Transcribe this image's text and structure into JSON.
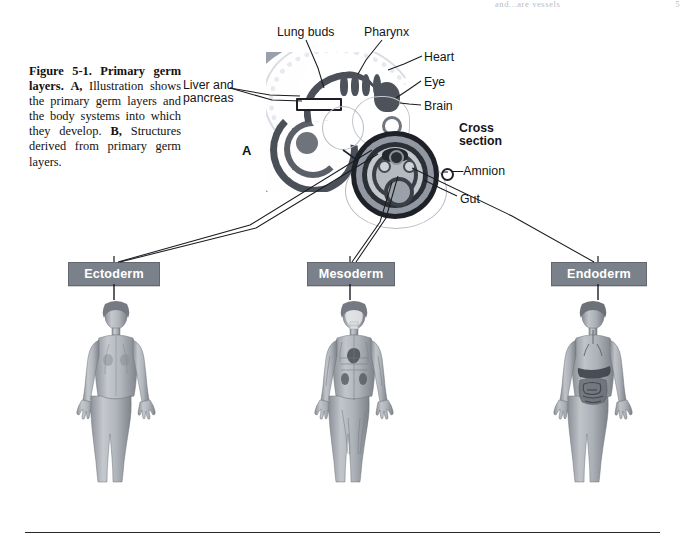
{
  "page": {
    "running_head_left": "and...are vessels",
    "running_head_right": "5"
  },
  "caption": {
    "figure_number": "Figure 5-1.",
    "figure_title": "Primary germ layers.",
    "part_a_letter": "A,",
    "part_a_text": "Illustration shows the primary germ layers and the body systems into which they develop.",
    "part_b_letter": "B,",
    "part_b_text": "Structures derived from primary germ layers.",
    "full_text": "Figure 5-1. Primary germ layers. A, Illustration shows the primary germ layers and the body systems into which they develop. B, Structures derived from primary germ layers."
  },
  "panel_a": {
    "letter": "A",
    "labels": {
      "lung_buds": "Lung buds",
      "pharynx": "Pharynx",
      "heart": "Heart",
      "eye": "Eye",
      "brain": "Brain",
      "liver_and_pancreas_line1": "Liver and",
      "liver_and_pancreas_line2": "pancreas"
    }
  },
  "cross_section": {
    "title_line1": "Cross",
    "title_line2": "section",
    "amnion_label": "—Amnion",
    "gut_label": "Gut"
  },
  "germ_layers": [
    {
      "id": "ectoderm",
      "label": "Ectoderm",
      "figure_alt": "Female body figure showing skin and nervous system derivatives"
    },
    {
      "id": "mesoderm",
      "label": "Mesoderm",
      "figure_alt": "Female body figure showing muscles, skeleton, heart and kidneys"
    },
    {
      "id": "endoderm",
      "label": "Endoderm",
      "figure_alt": "Female body figure showing digestive and respiratory linings"
    }
  ],
  "colors": {
    "box_fill": "#7b818b",
    "box_text": "#ffffff",
    "panel_bg": "#9aa0ab",
    "ink": "#14110f",
    "rule": "#25272c"
  }
}
